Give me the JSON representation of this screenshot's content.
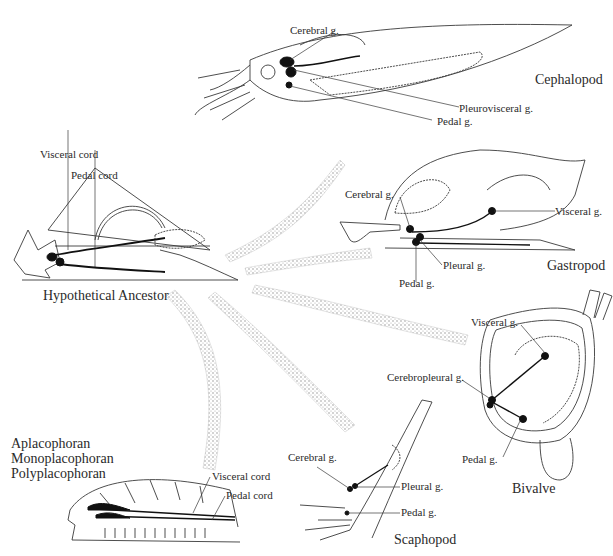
{
  "figure": {
    "central_label": "Hypothetical Ancestor",
    "organisms": {
      "ancestor": {
        "name": "Hypothetical Ancestor",
        "labels": [
          "Visceral cord",
          "Pedal cord"
        ]
      },
      "cephalopod": {
        "name": "Cephalopod",
        "labels": [
          "Cerebral g.",
          "Pleurovisceral g.",
          "Pedal g."
        ]
      },
      "gastropod": {
        "name": "Gastropod",
        "labels": [
          "Cerebral g.",
          "Visceral g.",
          "Pleural g.",
          "Pedal g."
        ]
      },
      "bivalve": {
        "name": "Bivalve",
        "labels": [
          "Visceral g.",
          "Cerebropleural g.",
          "Pedal g."
        ]
      },
      "scaphopod": {
        "name": "Scaphopod",
        "labels": [
          "Cerebral g.",
          "Pleural g.",
          "Pedal g."
        ]
      },
      "placophoran": {
        "names": [
          "Aplacophoran",
          "Monoplacophoran",
          "Polyplacophoran"
        ],
        "labels": [
          "Visceral cord",
          "Pedal cord"
        ]
      }
    },
    "colors": {
      "line": "#3a3a3a",
      "ganglion": "#111111",
      "arrow_stipple": "#9a9a9a"
    }
  }
}
